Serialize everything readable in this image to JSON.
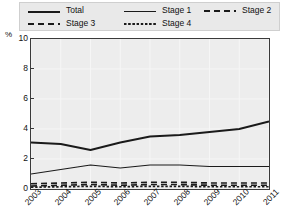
{
  "chart_data": {
    "type": "line",
    "title": "",
    "xlabel": "",
    "ylabel": "%",
    "ylim": [
      0,
      10
    ],
    "yticks": [
      0,
      2,
      4,
      6,
      8,
      10
    ],
    "grid": true,
    "legend_position": "top",
    "x": [
      "2003",
      "2004",
      "2005",
      "2006",
      "2007",
      "2008",
      "2009",
      "2010",
      "2011"
    ],
    "series": [
      {
        "name": "Total",
        "style": "solid-thick",
        "values": [
          3.1,
          3.0,
          2.6,
          3.1,
          3.5,
          3.6,
          3.8,
          4.0,
          4.5
        ]
      },
      {
        "name": "Stage 1",
        "style": "solid-thin",
        "values": [
          1.0,
          1.3,
          1.6,
          1.4,
          1.6,
          1.6,
          1.5,
          1.5,
          1.5
        ]
      },
      {
        "name": "Stage 2",
        "style": "dashed",
        "values": [
          0.35,
          0.4,
          0.45,
          0.4,
          0.45,
          0.45,
          0.4,
          0.4,
          0.4
        ]
      },
      {
        "name": "Stage 3",
        "style": "dashed",
        "values": [
          0.2,
          0.25,
          0.3,
          0.25,
          0.3,
          0.3,
          0.25,
          0.25,
          0.25
        ]
      },
      {
        "name": "Stage 4",
        "style": "dotted",
        "values": [
          0.12,
          0.15,
          0.18,
          0.15,
          0.18,
          0.18,
          0.15,
          0.15,
          0.15
        ]
      }
    ]
  },
  "legend": {
    "rows": [
      [
        {
          "label": "Total",
          "swatch": "solid-thick"
        },
        {
          "label": "Stage 1",
          "swatch": "solid-thin"
        },
        {
          "label": "Stage 2",
          "swatch": "dashed"
        }
      ],
      [
        {
          "label": "Stage 3",
          "swatch": "dashed"
        },
        {
          "label": "Stage 4",
          "swatch": "dotted"
        }
      ]
    ]
  },
  "axis": {
    "unit": "%"
  },
  "colors": {
    "line": "#1a1a1a",
    "frame": "#3a3a3a",
    "plot_bg": "#ededed",
    "gridline": "#f6f6f6",
    "legend_bg": "#e9e9e9"
  }
}
